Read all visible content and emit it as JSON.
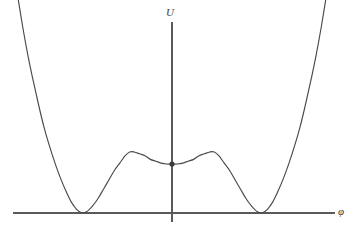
{
  "figure": {
    "title": "",
    "background_color": "#ffffff",
    "line_color": "#4a4a4a",
    "axis_color": "#5a5a5a",
    "marker_color": "#3a3a3a",
    "width": 360,
    "height": 232
  },
  "axes": {
    "vertical": {
      "label": "U",
      "name": "U",
      "x_px": 172,
      "top_px": 22,
      "bottom_px": 222
    },
    "horizontal": {
      "label": "φ",
      "name": "phi",
      "y_px": 213,
      "left_px": 13,
      "right_px": 335
    }
  },
  "marker": {
    "label": "",
    "x_px": 172,
    "y_px": 164,
    "radius_px": 2.6,
    "description": "filled dot at local minimum at phi = 0"
  },
  "chart_data": {
    "type": "line",
    "title": "",
    "xlabel": "φ",
    "ylabel": "U",
    "grid": false,
    "legend": null,
    "xlim": [
      -2.05,
      2.05
    ],
    "ylim": [
      -0.08,
      1.25
    ],
    "annotations": [
      {
        "kind": "point-marker",
        "x": 0.0,
        "y": 0.265,
        "style": "filled-circle"
      }
    ],
    "features": {
      "global_minima": [
        {
          "x": -1.0,
          "y": 0.0
        },
        {
          "x": 1.0,
          "y": 0.0
        }
      ],
      "local_minimum": {
        "x": 0.0,
        "y": 0.265
      },
      "local_maxima": [
        {
          "x": -0.47,
          "y": 0.33
        },
        {
          "x": 0.47,
          "y": 0.33
        }
      ],
      "shape": "symmetric triple-well effective potential"
    },
    "series": [
      {
        "name": "U(φ)",
        "color": "#4a4a4a",
        "x": [
          -1.72,
          -1.66,
          -1.6,
          -1.54,
          -1.48,
          -1.42,
          -1.36,
          -1.3,
          -1.24,
          -1.18,
          -1.12,
          -1.06,
          -1.0,
          -0.94,
          -0.88,
          -0.82,
          -0.76,
          -0.7,
          -0.64,
          -0.58,
          -0.52,
          -0.47,
          -0.42,
          -0.36,
          -0.3,
          -0.24,
          -0.18,
          -0.12,
          -0.06,
          0.0,
          0.06,
          0.12,
          0.18,
          0.24,
          0.3,
          0.36,
          0.42,
          0.47,
          0.52,
          0.58,
          0.64,
          0.7,
          0.76,
          0.82,
          0.88,
          0.94,
          1.0,
          1.06,
          1.12,
          1.18,
          1.24,
          1.3,
          1.36,
          1.42,
          1.48,
          1.54,
          1.6,
          1.66,
          1.72
        ],
        "y": [
          1.19,
          1.01,
          0.85,
          0.71,
          0.58,
          0.46,
          0.36,
          0.27,
          0.19,
          0.12,
          0.06,
          0.02,
          0.0,
          0.01,
          0.04,
          0.08,
          0.13,
          0.18,
          0.23,
          0.27,
          0.31,
          0.33,
          0.33,
          0.32,
          0.31,
          0.29,
          0.28,
          0.27,
          0.265,
          0.265,
          0.265,
          0.27,
          0.28,
          0.29,
          0.31,
          0.32,
          0.33,
          0.33,
          0.31,
          0.27,
          0.23,
          0.18,
          0.13,
          0.08,
          0.04,
          0.01,
          0.0,
          0.02,
          0.06,
          0.12,
          0.19,
          0.27,
          0.36,
          0.46,
          0.58,
          0.71,
          0.85,
          1.01,
          1.19
        ]
      }
    ]
  }
}
